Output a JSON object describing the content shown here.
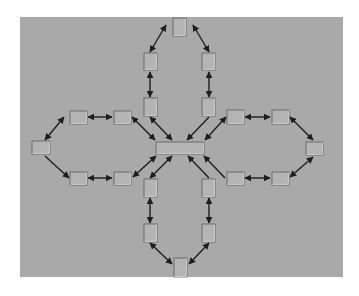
{
  "diagram": {
    "title": "",
    "background": {
      "x": 20,
      "y": 17,
      "w": 323,
      "h": 260,
      "fill": "#a9a9a9"
    },
    "colors": {
      "node_fill": "#b4b4b4",
      "node_border_dark": "#5a5a5a",
      "node_border_light": "#dcdcdc",
      "edge": "#1e1e1e"
    },
    "nodes": [
      {
        "id": "hub",
        "label": "",
        "x": 156,
        "y": 142,
        "w": 48,
        "h": 12
      },
      {
        "id": "top-apex",
        "label": "",
        "x": 173,
        "y": 18,
        "w": 13,
        "h": 18
      },
      {
        "id": "top-left-1",
        "label": "",
        "x": 144,
        "y": 53,
        "w": 13,
        "h": 17
      },
      {
        "id": "top-right-1",
        "label": "",
        "x": 202,
        "y": 53,
        "w": 13,
        "h": 17
      },
      {
        "id": "top-left-2",
        "label": "",
        "x": 144,
        "y": 98,
        "w": 13,
        "h": 18
      },
      {
        "id": "top-right-2",
        "label": "",
        "x": 202,
        "y": 98,
        "w": 13,
        "h": 18
      },
      {
        "id": "left-apex",
        "label": "",
        "x": 32,
        "y": 141,
        "w": 18,
        "h": 13
      },
      {
        "id": "left-upper-1",
        "label": "",
        "x": 70,
        "y": 111,
        "w": 17,
        "h": 13
      },
      {
        "id": "left-upper-2",
        "label": "",
        "x": 114,
        "y": 111,
        "w": 17,
        "h": 13
      },
      {
        "id": "left-lower-1",
        "label": "",
        "x": 70,
        "y": 172,
        "w": 17,
        "h": 13
      },
      {
        "id": "left-lower-2",
        "label": "",
        "x": 114,
        "y": 172,
        "w": 17,
        "h": 13
      },
      {
        "id": "right-apex",
        "label": "",
        "x": 306,
        "y": 142,
        "w": 17,
        "h": 13
      },
      {
        "id": "right-upper-1",
        "label": "",
        "x": 227,
        "y": 110,
        "w": 17,
        "h": 14
      },
      {
        "id": "right-upper-2",
        "label": "",
        "x": 272,
        "y": 110,
        "w": 17,
        "h": 14
      },
      {
        "id": "right-lower-1",
        "label": "",
        "x": 227,
        "y": 172,
        "w": 17,
        "h": 13
      },
      {
        "id": "right-lower-2",
        "label": "",
        "x": 272,
        "y": 172,
        "w": 17,
        "h": 13
      },
      {
        "id": "bottom-left-1",
        "label": "",
        "x": 144,
        "y": 179,
        "w": 13,
        "h": 18
      },
      {
        "id": "bottom-right-1",
        "label": "",
        "x": 202,
        "y": 179,
        "w": 13,
        "h": 18
      },
      {
        "id": "bottom-left-2",
        "label": "",
        "x": 144,
        "y": 224,
        "w": 13,
        "h": 18
      },
      {
        "id": "bottom-right-2",
        "label": "",
        "x": 202,
        "y": 224,
        "w": 13,
        "h": 18
      },
      {
        "id": "bottom-apex",
        "label": "",
        "x": 174,
        "y": 258,
        "w": 13,
        "h": 19
      }
    ],
    "edges": [
      {
        "from": [
          166,
          25
        ],
        "to": [
          150,
          52
        ],
        "bidirectional": true
      },
      {
        "from": [
          193,
          25
        ],
        "to": [
          209,
          52
        ],
        "bidirectional": true
      },
      {
        "from": [
          150,
          72
        ],
        "to": [
          150,
          97
        ],
        "bidirectional": true
      },
      {
        "from": [
          209,
          72
        ],
        "to": [
          209,
          97
        ],
        "bidirectional": true
      },
      {
        "from": [
          150,
          117
        ],
        "to": [
          172,
          140
        ],
        "bidirectional": true
      },
      {
        "from": [
          209,
          117
        ],
        "to": [
          187,
          140
        ],
        "bidirectional": false
      },
      {
        "from": [
          64,
          117
        ],
        "to": [
          45,
          140
        ],
        "bidirectional": true
      },
      {
        "from": [
          88,
          117
        ],
        "to": [
          112,
          117
        ],
        "bidirectional": true
      },
      {
        "from": [
          132,
          117
        ],
        "to": [
          155,
          140
        ],
        "bidirectional": true
      },
      {
        "from": [
          45,
          156
        ],
        "to": [
          69,
          178
        ],
        "bidirectional": false
      },
      {
        "from": [
          88,
          178
        ],
        "to": [
          112,
          178
        ],
        "bidirectional": true
      },
      {
        "from": [
          133,
          177
        ],
        "to": [
          156,
          156
        ],
        "bidirectional": true
      },
      {
        "from": [
          226,
          117
        ],
        "to": [
          205,
          140
        ],
        "bidirectional": true
      },
      {
        "from": [
          245,
          117
        ],
        "to": [
          270,
          117
        ],
        "bidirectional": true
      },
      {
        "from": [
          290,
          117
        ],
        "to": [
          313,
          140
        ],
        "bidirectional": true
      },
      {
        "from": [
          225,
          178
        ],
        "to": [
          204,
          156
        ],
        "bidirectional": false
      },
      {
        "from": [
          245,
          178
        ],
        "to": [
          270,
          178
        ],
        "bidirectional": true
      },
      {
        "from": [
          290,
          177
        ],
        "to": [
          313,
          157
        ],
        "bidirectional": true
      },
      {
        "from": [
          150,
          178
        ],
        "to": [
          172,
          156
        ],
        "bidirectional": true
      },
      {
        "from": [
          209,
          178
        ],
        "to": [
          188,
          156
        ],
        "bidirectional": false
      },
      {
        "from": [
          150,
          198
        ],
        "to": [
          150,
          223
        ],
        "bidirectional": true
      },
      {
        "from": [
          209,
          198
        ],
        "to": [
          209,
          223
        ],
        "bidirectional": true
      },
      {
        "from": [
          150,
          243
        ],
        "to": [
          172,
          264
        ],
        "bidirectional": true
      },
      {
        "from": [
          209,
          243
        ],
        "to": [
          189,
          264
        ],
        "bidirectional": true
      }
    ]
  }
}
